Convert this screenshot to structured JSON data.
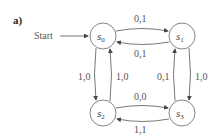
{
  "panel_label": "a)",
  "start_label": "Start",
  "states": [
    {
      "id": "s0",
      "base": "s",
      "sub": "0"
    },
    {
      "id": "s1",
      "base": "s",
      "sub": "1"
    },
    {
      "id": "s2",
      "base": "s",
      "sub": "2"
    },
    {
      "id": "s3",
      "base": "s",
      "sub": "3"
    }
  ],
  "edges": [
    {
      "from": "s0",
      "to": "s1",
      "label": "0,1"
    },
    {
      "from": "s1",
      "to": "s0",
      "label": "0,1"
    },
    {
      "from": "s0",
      "to": "s2",
      "label": "1,0"
    },
    {
      "from": "s2",
      "to": "s0",
      "label": "1,0"
    },
    {
      "from": "s3",
      "to": "s1",
      "label": "0,1"
    },
    {
      "from": "s1",
      "to": "s3",
      "label": "1,0"
    },
    {
      "from": "s2",
      "to": "s3",
      "label": "0,0"
    },
    {
      "from": "s3",
      "to": "s2",
      "label": "1,1"
    }
  ],
  "colors": {
    "stroke": "#555555",
    "text": "#555555"
  }
}
